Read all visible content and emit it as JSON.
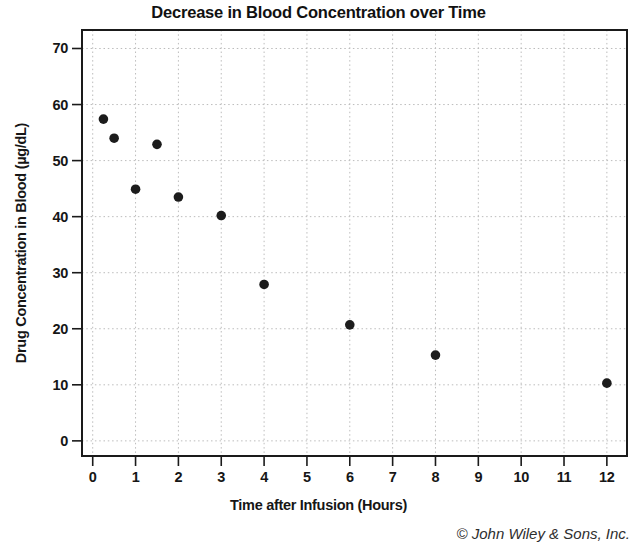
{
  "figure": {
    "copyright": "© John Wiley & Sons, Inc."
  },
  "chart_data": {
    "type": "scatter",
    "title": "Decrease in Blood Concentration over Time",
    "xlabel": "Time after Infusion (Hours)",
    "ylabel": "Drug Concentration in Blood (µg/dL)",
    "x": [
      0.25,
      0.5,
      1,
      1.5,
      2,
      3,
      4,
      6,
      8,
      12
    ],
    "y": [
      57.4,
      54.0,
      44.9,
      52.9,
      43.5,
      40.2,
      27.9,
      20.7,
      15.3,
      10.3
    ],
    "xlim": [
      -0.25,
      12.47
    ],
    "ylim": [
      -2.7,
      73.3
    ],
    "xticks": [
      0,
      1,
      2,
      3,
      4,
      5,
      6,
      7,
      8,
      9,
      10,
      11,
      12
    ],
    "yticks": [
      0,
      10,
      20,
      30,
      40,
      50,
      60,
      70
    ],
    "grid": "dotted-both-axes",
    "legend": "none",
    "marker": {
      "shape": "circle",
      "color": "#1c1c1c",
      "radius": 4.8
    },
    "colors": {
      "axis": "#1a1a1a",
      "grid": "#bcbcbc",
      "background": "#ffffff"
    }
  }
}
